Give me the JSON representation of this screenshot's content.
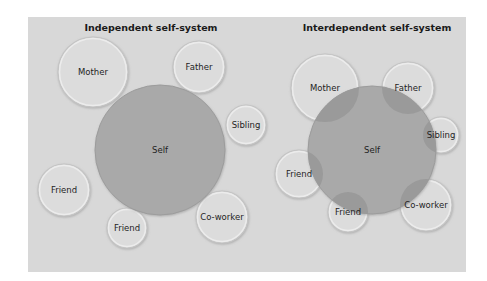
{
  "panel": {
    "x": 28,
    "y": 17,
    "width": 438,
    "height": 255,
    "color": "#d8d8d8"
  },
  "diagrams": [
    {
      "title": "Independent self-system",
      "title_pos": {
        "x": 151,
        "y": 31
      },
      "self": {
        "label": "Self",
        "cx": 160,
        "cy": 150,
        "r": 65,
        "color": "#a9a9a9"
      },
      "others": [
        {
          "label": "Mother",
          "cx": 93,
          "cy": 72,
          "r": 35
        },
        {
          "label": "Father",
          "cx": 199,
          "cy": 67,
          "r": 26
        },
        {
          "label": "Sibling",
          "cx": 246,
          "cy": 125,
          "r": 20
        },
        {
          "label": "Friend",
          "cx": 64,
          "cy": 190,
          "r": 26
        },
        {
          "label": "Friend",
          "cx": 127,
          "cy": 228,
          "r": 20
        },
        {
          "label": "Co-worker",
          "cx": 222,
          "cy": 217,
          "r": 26
        }
      ]
    },
    {
      "title": "Interdependent self-system",
      "title_pos": {
        "x": 377,
        "y": 31
      },
      "self": {
        "label": "Self",
        "cx": 372,
        "cy": 150,
        "r": 64,
        "color": "#a9a9a9"
      },
      "others": [
        {
          "label": "Mother",
          "cx": 325,
          "cy": 88,
          "r": 34
        },
        {
          "label": "Father",
          "cx": 408,
          "cy": 88,
          "r": 26
        },
        {
          "label": "Sibling",
          "cx": 441,
          "cy": 135,
          "r": 18
        },
        {
          "label": "Friend",
          "cx": 299,
          "cy": 174,
          "r": 24
        },
        {
          "label": "Friend",
          "cx": 348,
          "cy": 212,
          "r": 20
        },
        {
          "label": "Co-worker",
          "cx": 426,
          "cy": 205,
          "r": 26
        }
      ]
    }
  ],
  "colors": {
    "bubble": "#dcdcdc",
    "bubble_stroke": "#c4c4c4",
    "self": "#a9a9a9",
    "overlap": "#9a9a9a",
    "text": "#1e1e1e"
  }
}
